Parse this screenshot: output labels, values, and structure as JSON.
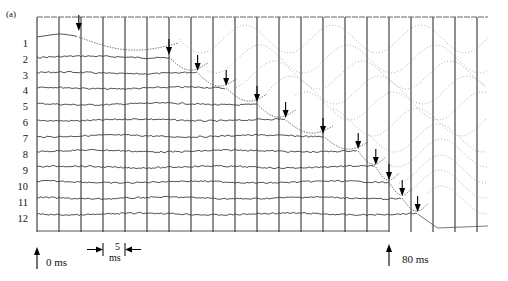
{
  "figure": {
    "panel_label": "(a)",
    "start_label": "0 ms",
    "end_label": "80 ms",
    "scale_value": "5",
    "scale_unit": "ms"
  },
  "chart_data": {
    "type": "line",
    "title": "",
    "xlabel": "time (ms)",
    "ylabel": "",
    "x_range_ms": [
      0,
      100
    ],
    "grid": {
      "vertical_spacing_ms": 5,
      "horizontal": false
    },
    "markers": [
      {
        "label": "0 ms",
        "time_ms": 0
      },
      {
        "label": "80 ms",
        "time_ms": 80
      }
    ],
    "scale_bar": {
      "value": 5,
      "unit": "ms"
    },
    "traces": [
      {
        "name": "1",
        "onset_ms": 9.5
      },
      {
        "name": "2",
        "onset_ms": 30
      },
      {
        "name": "3",
        "onset_ms": 36.5
      },
      {
        "name": "4",
        "onset_ms": 43
      },
      {
        "name": "5",
        "onset_ms": 50
      },
      {
        "name": "6",
        "onset_ms": 56.5
      },
      {
        "name": "7",
        "onset_ms": 65
      },
      {
        "name": "8",
        "onset_ms": 73
      },
      {
        "name": "9",
        "onset_ms": 77
      },
      {
        "name": "10",
        "onset_ms": 80
      },
      {
        "name": "11",
        "onset_ms": 83
      },
      {
        "name": "12",
        "onset_ms": 86.5
      }
    ]
  },
  "rows": [
    "1",
    "2",
    "3",
    "4",
    "5",
    "6",
    "7",
    "8",
    "9",
    "10",
    "11",
    "12"
  ]
}
